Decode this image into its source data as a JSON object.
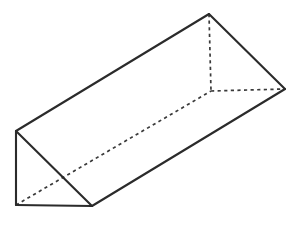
{
  "figure": {
    "kind": "triangular-prism",
    "caption": "",
    "projection": "oblique",
    "canvas": {
      "width": 301,
      "height": 227
    },
    "background_color": "#FFFFFF",
    "style": {
      "visible_edge_color": "#2B2B2B",
      "visible_edge_width": 2.1,
      "hidden_edge_color": "#3A3A3A",
      "hidden_edge_width": 1.7,
      "hidden_edge_dash": "3.2 3.4",
      "face_fill_color": "#FFFFFF"
    },
    "vertices": {
      "front_top": {
        "label": "A",
        "x": 16,
        "y": 131
      },
      "front_bottom": {
        "label": "B",
        "x": 16,
        "y": 205
      },
      "front_apex": {
        "label": "C",
        "x": 92,
        "y": 206
      },
      "back_top": {
        "label": "D",
        "x": 209,
        "y": 14
      },
      "back_hidden": {
        "label": "E",
        "x": 211,
        "y": 91
      },
      "back_right": {
        "label": "F",
        "x": 285,
        "y": 89
      }
    },
    "faces": [
      {
        "name": "front-triangle-face",
        "points": "16,131 16,205 92,206",
        "visible": true
      },
      {
        "name": "top-rectangle-face",
        "points": "16,131 209,14 285,89 92,206",
        "visible": true
      },
      {
        "name": "back-triangle-face",
        "points": "209,14 211,91 285,89",
        "visible": true
      }
    ],
    "edges_visible": [
      {
        "name": "front-left-vertical-edge",
        "from": "front_top",
        "to": "front_bottom",
        "d": "M16,131 L16,205"
      },
      {
        "name": "front-bottom-base-edge",
        "from": "front_bottom",
        "to": "front_apex",
        "d": "M16,205 L92,206"
      },
      {
        "name": "front-hypotenuse-edge",
        "from": "front_top",
        "to": "front_apex",
        "d": "M16,131 L92,206"
      },
      {
        "name": "top-left-long-edge",
        "from": "front_top",
        "to": "back_top",
        "d": "M16,131 L209,14"
      },
      {
        "name": "back-left-slant-edge",
        "from": "back_top",
        "to": "back_right",
        "d": "M209,14 L285,89"
      },
      {
        "name": "front-long-bottom-edge",
        "from": "front_apex",
        "to": "back_right",
        "d": "M92,206 L285,89"
      },
      {
        "name": "back-right-lower-edge",
        "from": "back_right",
        "to": "front_apex",
        "d": "M285,89 L92,206"
      }
    ],
    "edges_hidden": [
      {
        "name": "hidden-vertical-edge",
        "from": "back_top",
        "to": "back_hidden",
        "d": "M209,14 L211,91"
      },
      {
        "name": "hidden-horizontal-edge",
        "from": "back_hidden",
        "to": "back_right",
        "d": "M211,91 L285,89"
      },
      {
        "name": "hidden-long-diagonal-edge",
        "from": "front_bottom",
        "to": "back_hidden",
        "d": "M16,205 L211,91"
      }
    ]
  }
}
